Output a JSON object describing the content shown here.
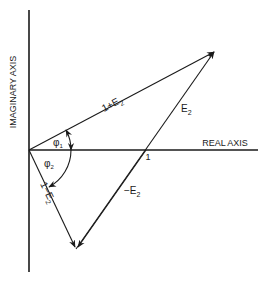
{
  "diagram": {
    "type": "phasor-diagram",
    "axes": {
      "real_label": "REAL AXIS",
      "imaginary_label": "IMAGINARY AXIS",
      "unit_tick_label": "1"
    },
    "vectors": [
      {
        "label_main": "1+E",
        "label_sub": "2",
        "from": "origin",
        "to": "upper-right"
      },
      {
        "label_main": "E",
        "label_sub": "2",
        "from": "unit-point",
        "to": "upper-right"
      },
      {
        "label_main": "−E",
        "label_sub": "2",
        "from": "unit-point",
        "to": "lower-left"
      },
      {
        "label_main": "1−E",
        "label_sub": "2",
        "from": "origin",
        "to": "lower-left"
      }
    ],
    "angles": [
      {
        "label_main": "φ",
        "label_sub": "1"
      },
      {
        "label_main": "φ",
        "label_sub": "2"
      }
    ],
    "colors": {
      "ink": "#1a1a1a",
      "background": "#ffffff"
    }
  }
}
